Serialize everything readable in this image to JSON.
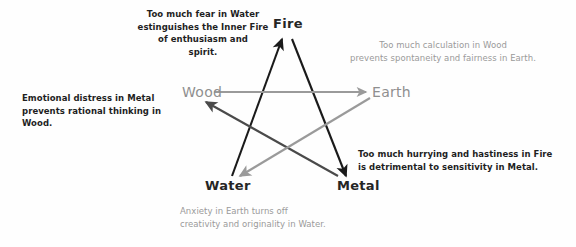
{
  "diagram": {
    "nodes": [
      {
        "id": "fire",
        "label": "Fire",
        "x": 288,
        "y": 30,
        "color": "#252525",
        "style": "dark"
      },
      {
        "id": "wood",
        "label": "Wood",
        "x": 208,
        "y": 94,
        "color": "#8f8f8f",
        "style": "gray"
      },
      {
        "id": "earth",
        "label": "Earth",
        "x": 368,
        "y": 94,
        "color": "#8f8f8f",
        "style": "gray"
      },
      {
        "id": "water",
        "label": "Water",
        "x": 240,
        "y": 185,
        "color": "#252525",
        "style": "dark"
      },
      {
        "id": "metal",
        "label": "Metal",
        "x": 344,
        "y": 185,
        "color": "#252525",
        "style": "dark"
      }
    ],
    "arrows": [
      {
        "id": "water-to-fire",
        "from": "Water",
        "to": "Fire",
        "color": "#1a1a1a"
      },
      {
        "id": "fire-to-metal",
        "from": "Fire",
        "to": "Metal",
        "color": "#1a1a1a"
      },
      {
        "id": "metal-to-wood",
        "from": "Metal",
        "to": "Wood",
        "color": "#4a4a4a"
      },
      {
        "id": "wood-to-earth",
        "from": "Wood",
        "to": "Earth",
        "color": "#9a9a9a"
      },
      {
        "id": "earth-to-water",
        "from": "Earth",
        "to": "Water",
        "color": "#9a9a9a"
      }
    ],
    "captions": {
      "water_fire": "Too much fear in Water\nestinguishes the Inner Fire\nof enthusiasm and\nspirit.",
      "wood_earth": "Too much calculation in Wood\nprevents spontaneity and fairness in Earth.",
      "metal_wood": "Emotional distress in Metal\nprevents rational thinking in Wood.",
      "fire_metal": "Too much hurrying and hastiness in Fire\nis detrimental to sensitivity in Metal.",
      "earth_water": "Anxiety in Earth turns off\ncreativity and originality in Water."
    },
    "colors": {
      "dark_text": "#1f1f1f",
      "gray_text": "#9a9a9a",
      "dark_arrow": "#1a1a1a",
      "mid_arrow": "#4a4a4a",
      "gray_arrow": "#9a9a9a",
      "background": "#ffffff"
    }
  }
}
